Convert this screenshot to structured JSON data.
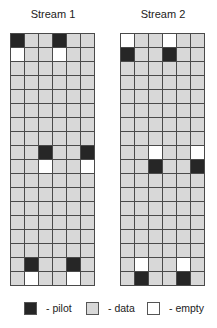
{
  "colors": {
    "pilot": "#262626",
    "data": "#d8d8d8",
    "empty": "#ffffff",
    "gridline": "#4a4a4a"
  },
  "streams": [
    {
      "title": "Stream 1",
      "rows": [
        [
          "pilot",
          "data",
          "data",
          "pilot",
          "data",
          "data"
        ],
        [
          "empty",
          "data",
          "data",
          "empty",
          "data",
          "data"
        ],
        [
          "data",
          "data",
          "data",
          "data",
          "data",
          "data"
        ],
        [
          "data",
          "data",
          "data",
          "data",
          "data",
          "data"
        ],
        [
          "data",
          "data",
          "data",
          "data",
          "data",
          "data"
        ],
        [
          "data",
          "data",
          "data",
          "data",
          "data",
          "data"
        ],
        [
          "data",
          "data",
          "data",
          "data",
          "data",
          "data"
        ],
        [
          "data",
          "data",
          "data",
          "data",
          "data",
          "data"
        ],
        [
          "data",
          "data",
          "pilot",
          "data",
          "data",
          "pilot"
        ],
        [
          "data",
          "data",
          "empty",
          "data",
          "data",
          "empty"
        ],
        [
          "data",
          "data",
          "data",
          "data",
          "data",
          "data"
        ],
        [
          "data",
          "data",
          "data",
          "data",
          "data",
          "data"
        ],
        [
          "data",
          "data",
          "data",
          "data",
          "data",
          "data"
        ],
        [
          "data",
          "data",
          "data",
          "data",
          "data",
          "data"
        ],
        [
          "data",
          "data",
          "data",
          "data",
          "data",
          "data"
        ],
        [
          "data",
          "data",
          "data",
          "data",
          "data",
          "data"
        ],
        [
          "data",
          "pilot",
          "data",
          "data",
          "pilot",
          "data"
        ],
        [
          "data",
          "empty",
          "data",
          "data",
          "empty",
          "data"
        ]
      ]
    },
    {
      "title": "Stream 2",
      "rows": [
        [
          "empty",
          "data",
          "data",
          "empty",
          "data",
          "data"
        ],
        [
          "pilot",
          "data",
          "data",
          "pilot",
          "data",
          "data"
        ],
        [
          "data",
          "data",
          "data",
          "data",
          "data",
          "data"
        ],
        [
          "data",
          "data",
          "data",
          "data",
          "data",
          "data"
        ],
        [
          "data",
          "data",
          "data",
          "data",
          "data",
          "data"
        ],
        [
          "data",
          "data",
          "data",
          "data",
          "data",
          "data"
        ],
        [
          "data",
          "data",
          "data",
          "data",
          "data",
          "data"
        ],
        [
          "data",
          "data",
          "data",
          "data",
          "data",
          "data"
        ],
        [
          "data",
          "data",
          "empty",
          "data",
          "data",
          "empty"
        ],
        [
          "data",
          "data",
          "pilot",
          "data",
          "data",
          "pilot"
        ],
        [
          "data",
          "data",
          "data",
          "data",
          "data",
          "data"
        ],
        [
          "data",
          "data",
          "data",
          "data",
          "data",
          "data"
        ],
        [
          "data",
          "data",
          "data",
          "data",
          "data",
          "data"
        ],
        [
          "data",
          "data",
          "data",
          "data",
          "data",
          "data"
        ],
        [
          "data",
          "data",
          "data",
          "data",
          "data",
          "data"
        ],
        [
          "data",
          "data",
          "data",
          "data",
          "data",
          "data"
        ],
        [
          "data",
          "empty",
          "data",
          "data",
          "empty",
          "data"
        ],
        [
          "data",
          "pilot",
          "data",
          "data",
          "pilot",
          "data"
        ]
      ]
    }
  ],
  "legend": [
    {
      "type": "pilot",
      "label": "- pilot"
    },
    {
      "type": "data",
      "label": "- data"
    },
    {
      "type": "empty",
      "label": "- empty"
    }
  ]
}
